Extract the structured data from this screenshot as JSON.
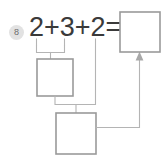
{
  "problem": {
    "number": "8",
    "equation": "2+3+2=",
    "operands": [
      "2",
      "3",
      "2"
    ],
    "operators": [
      "+",
      "+"
    ],
    "equals_sign": "="
  },
  "colors": {
    "badge_fill": "#e2e2e2",
    "badge_text": "#6d6d6d",
    "equation_text": "#3a3a3a",
    "box_stroke": "#9a9a9a",
    "box_fill": "#ffffff",
    "wire_stroke": "#b4b4b4",
    "arrow_fill": "#a8a8a8",
    "page_background": "#ffffff"
  },
  "boxes": {
    "answer": {
      "label": "",
      "x": 120,
      "y": 12,
      "w": 40,
      "h": 40
    },
    "partial_sum": {
      "label": "",
      "x": 37,
      "y": 59,
      "w": 36,
      "h": 37
    },
    "total": {
      "label": "",
      "x": 56,
      "y": 113,
      "w": 40,
      "h": 41
    }
  },
  "icons": {
    "arrow_up": "arrow-up-icon",
    "bracket": "group-bracket-icon"
  }
}
